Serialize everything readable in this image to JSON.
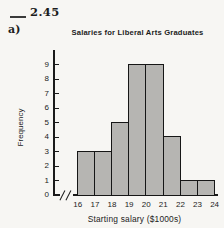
{
  "page": {
    "exercise_number": "2.45",
    "part_label": "a)",
    "background": "#f7f6f3"
  },
  "chart_data": {
    "type": "bar",
    "subtype": "histogram",
    "title": "Salaries for Liberal Arts Graduates",
    "xlabel": "Starting salary ($1000s)",
    "ylabel": "Frequency",
    "bin_edges": [
      16,
      17,
      18,
      19,
      20,
      21,
      22,
      23,
      24
    ],
    "x_tick_labels": [
      "16",
      "17",
      "18",
      "19",
      "20",
      "21",
      "22",
      "23",
      "24"
    ],
    "values": [
      3,
      3,
      5,
      9,
      9,
      4,
      1,
      1
    ],
    "y_ticks": [
      0,
      1,
      2,
      3,
      4,
      5,
      6,
      7,
      8,
      9
    ],
    "ylim": [
      0,
      9
    ],
    "grid": false,
    "legend": "none",
    "axis_break_before_first_bin": true,
    "colors": {
      "bar_fill": "#b6b5b2",
      "bar_stipple": "#83817e",
      "bar_border": "#161616",
      "axis": "#1a1a1a",
      "text": "#1c1c1c"
    }
  }
}
